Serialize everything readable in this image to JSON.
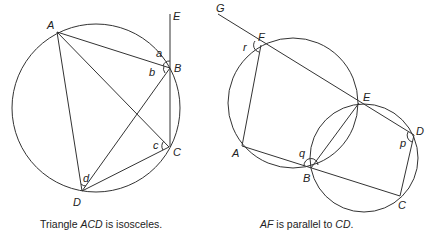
{
  "figures": [
    {
      "id": "left",
      "caption_prefix": "Triangle ",
      "caption_italic": "ACD",
      "caption_suffix": " is isosceles.",
      "points": {
        "A": "A",
        "B": "B",
        "C": "C",
        "D": "D",
        "E": "E"
      },
      "angles": {
        "a": "a",
        "b": "b",
        "c": "c",
        "d": "d"
      }
    },
    {
      "id": "right",
      "caption_italic1": "AF",
      "caption_mid": " is parallel to ",
      "caption_italic2": "CD",
      "caption_end": ".",
      "points": {
        "A": "A",
        "B": "B",
        "C": "C",
        "D": "D",
        "E": "E",
        "F": "F",
        "G": "G"
      },
      "angles": {
        "p": "p",
        "q": "q",
        "r": "r"
      }
    }
  ],
  "colors": {
    "stroke": "#333333",
    "text": "#222222",
    "background": "#ffffff"
  }
}
